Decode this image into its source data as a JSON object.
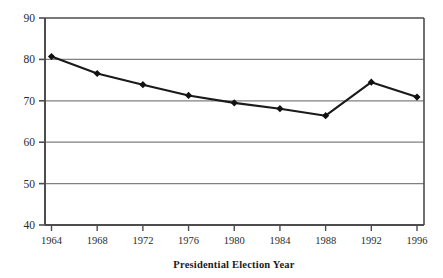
{
  "chart_data": {
    "type": "line",
    "title": "",
    "subtitle": "",
    "xlabel": "Presidential Election Year",
    "ylabel": "",
    "categories": [
      "1964",
      "1968",
      "1972",
      "1976",
      "1980",
      "1984",
      "1988",
      "1992",
      "1996"
    ],
    "x": [
      1964,
      1968,
      1972,
      1976,
      1980,
      1984,
      1988,
      1992,
      1996
    ],
    "values": [
      80.7,
      76.6,
      73.9,
      71.3,
      69.5,
      68.1,
      66.4,
      74.5,
      70.9
    ],
    "series": [
      {
        "name": "",
        "values": [
          80.7,
          76.6,
          73.9,
          71.3,
          69.5,
          68.1,
          66.4,
          74.5,
          70.9
        ]
      }
    ],
    "xlim": [
      1962,
      1998
    ],
    "ylim": [
      40,
      90
    ],
    "yticks": [
      40,
      50,
      60,
      70,
      80,
      90
    ],
    "ytick_labels": [
      "40",
      "50",
      "60",
      "70",
      "80",
      "90"
    ],
    "xticks": [
      1964,
      1968,
      1972,
      1976,
      1980,
      1984,
      1988,
      1992,
      1996
    ],
    "grid": true,
    "grid_axis": "y",
    "legend": false,
    "legend_position": "none",
    "marker": "diamond",
    "line_color": "#1a1a1a",
    "marker_color": "#111111",
    "grid_color": "#808080",
    "axis_color": "#4d4d4d",
    "background": "#ffffff",
    "annotations": []
  }
}
